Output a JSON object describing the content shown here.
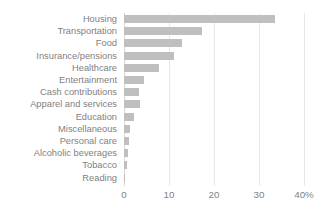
{
  "chart_data": {
    "type": "bar",
    "orientation": "horizontal",
    "title": "",
    "subtitle": "",
    "xlabel": "",
    "ylabel": "",
    "xlim": [
      0,
      40
    ],
    "ylim": null,
    "grid": true,
    "legend": null,
    "legend_position": "none",
    "categories": [
      "Housing",
      "Transportation",
      "Food",
      "Insurance/pensions",
      "Healthcare",
      "Entertainment",
      "Cash contributions",
      "Apparel and services",
      "Education",
      "Miscellaneous",
      "Personal care",
      "Alcoholic beverages",
      "Tobacco",
      "Reading"
    ],
    "values": [
      33.6,
      17.3,
      12.9,
      11.0,
      7.8,
      4.4,
      3.4,
      3.5,
      2.3,
      1.3,
      1.1,
      0.8,
      0.6,
      0.3
    ],
    "x_ticks": [
      0,
      10,
      20,
      30,
      40
    ],
    "x_tick_labels": [
      "0",
      "10",
      "20",
      "30",
      "40%"
    ],
    "bar_color": "#bfbfbf",
    "gridline_color": "#e8e8e8",
    "text_color": "#7f7f7f"
  }
}
